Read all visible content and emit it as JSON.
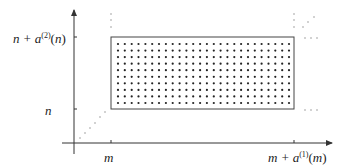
{
  "diagram": {
    "type": "lattice-rectangle",
    "y_labels": {
      "top": {
        "base": "n + a",
        "sup": "(2)",
        "arg": "(n)"
      },
      "bottom": {
        "text": "n"
      }
    },
    "x_labels": {
      "left": {
        "text": "m"
      },
      "right": {
        "base": "m + a",
        "sup": "(1)",
        "arg": "(m)"
      }
    },
    "grid": {
      "columns": 26,
      "rows": 10
    },
    "ellipsis_glyph": "⋯",
    "colors": {
      "stroke": "#333333",
      "dot": "#222222",
      "faint": "#999999"
    }
  }
}
